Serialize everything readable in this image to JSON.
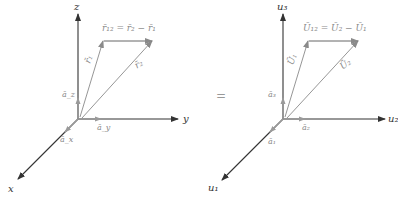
{
  "left_diagram": {
    "axes": {
      "z_label": "z",
      "y_label": "y",
      "x_label": "x"
    },
    "unit_vectors": {
      "az": "ā_z",
      "ay": "ā_y",
      "ax": "ā_x"
    },
    "vectors": {
      "r1": "r̄₁",
      "r2": "r̄₂",
      "r12_equation": "r̄₁₂ = r̄₂ − r̄₁"
    }
  },
  "equals_sign": "=",
  "right_diagram": {
    "axes": {
      "u3_label": "u₃",
      "u2_label": "u₂",
      "u1_label": "u₁"
    },
    "unit_vectors": {
      "a3": "ā₃",
      "a2": "ā₂",
      "a1": "ā₁"
    },
    "vectors": {
      "U1": "Ū₁",
      "U2": "Ū₂",
      "U12_equation": "Ū₁₂ = Ū₂ − Ū₁"
    }
  },
  "colors": {
    "axis": "#333333",
    "vector": "#8a8a8a",
    "unit_vector": "#9a9a9a"
  }
}
